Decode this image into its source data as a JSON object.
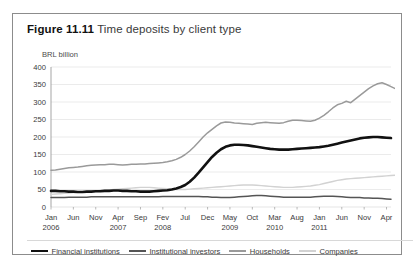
{
  "figure": {
    "number": "Figure 11.11",
    "title": "Time deposits by client type"
  },
  "axis": {
    "unit_label": "BRL billion",
    "y_ticks": [
      "400",
      "350",
      "300",
      "250",
      "200",
      "150",
      "100",
      "50",
      "0"
    ],
    "x_ticks": [
      {
        "month": "Jan",
        "year": "2006"
      },
      {
        "month": "Jun",
        "year": ""
      },
      {
        "month": "Nov",
        "year": ""
      },
      {
        "month": "Apr",
        "year": "2007"
      },
      {
        "month": "Sep",
        "year": ""
      },
      {
        "month": "Fev",
        "year": "2008"
      },
      {
        "month": "Jul",
        "year": ""
      },
      {
        "month": "Dec",
        "year": ""
      },
      {
        "month": "May",
        "year": "2009"
      },
      {
        "month": "Oct",
        "year": ""
      },
      {
        "month": "Mar",
        "year": "2010"
      },
      {
        "month": "Aug",
        "year": ""
      },
      {
        "month": "Jan",
        "year": "2011"
      },
      {
        "month": "Jun",
        "year": ""
      },
      {
        "month": "Nov",
        "year": ""
      },
      {
        "month": "Apr",
        "year": ""
      }
    ]
  },
  "legend": {
    "items": [
      {
        "label": "Financial institutions",
        "color": "#111111",
        "width": 2.6
      },
      {
        "label": "Institutional investors",
        "color": "#555555",
        "width": 1.5
      },
      {
        "label": "Households",
        "color": "#9a9a9a",
        "width": 1.5
      },
      {
        "label": "Companies",
        "color": "#d2d2d2",
        "width": 1.4
      }
    ]
  },
  "chart_data": {
    "type": "line",
    "title": "Time deposits by client type",
    "xlabel": "",
    "ylabel": "BRL billion",
    "ylim": [
      0,
      400
    ],
    "ytick_step": 50,
    "grid": true,
    "grid_color": "#e2e2e2",
    "legend_position": "bottom",
    "x_tick_labels": [
      "Jan 2006",
      "Jun",
      "Nov",
      "Apr 2007",
      "Sep",
      "Fev 2008",
      "Jul",
      "Dec",
      "May 2009",
      "Oct",
      "Mar 2010",
      "Aug",
      "Jan 2011",
      "Jun",
      "Nov",
      "Apr"
    ],
    "x_tick_index": [
      0,
      5,
      10,
      15,
      20,
      25,
      30,
      35,
      40,
      45,
      50,
      55,
      60,
      65,
      70,
      75
    ],
    "x_count": 77,
    "series": [
      {
        "name": "Financial institutions",
        "color": "#111111",
        "line_width": 2.6,
        "values": [
          46,
          46,
          45,
          45,
          44,
          44,
          43,
          43,
          44,
          44,
          45,
          45,
          46,
          46,
          47,
          47,
          46,
          46,
          45,
          45,
          44,
          44,
          44,
          45,
          46,
          47,
          48,
          50,
          53,
          57,
          63,
          72,
          84,
          98,
          113,
          128,
          143,
          155,
          165,
          172,
          176,
          178,
          178,
          177,
          176,
          174,
          172,
          170,
          168,
          166,
          165,
          164,
          164,
          164,
          165,
          166,
          167,
          168,
          169,
          170,
          171,
          173,
          175,
          178,
          181,
          184,
          187,
          190,
          193,
          196,
          198,
          199,
          200,
          200,
          199,
          198,
          197
        ]
      },
      {
        "name": "Institutional investors",
        "color": "#555555",
        "line_width": 1.5,
        "values": [
          27,
          27,
          27,
          27,
          28,
          28,
          28,
          28,
          28,
          29,
          29,
          29,
          29,
          29,
          29,
          29,
          29,
          29,
          29,
          29,
          29,
          29,
          29,
          29,
          29,
          30,
          30,
          30,
          30,
          30,
          30,
          30,
          30,
          30,
          29,
          29,
          28,
          28,
          27,
          27,
          27,
          28,
          29,
          30,
          31,
          32,
          33,
          33,
          32,
          31,
          30,
          29,
          28,
          28,
          28,
          28,
          28,
          28,
          28,
          29,
          30,
          31,
          31,
          31,
          30,
          29,
          28,
          27,
          27,
          27,
          26,
          26,
          25,
          25,
          24,
          23,
          22
        ]
      },
      {
        "name": "Households",
        "color": "#9a9a9a",
        "line_width": 1.5,
        "values": [
          105,
          106,
          108,
          110,
          112,
          113,
          114,
          116,
          118,
          119,
          120,
          121,
          121,
          122,
          122,
          121,
          120,
          121,
          122,
          122,
          123,
          123,
          124,
          125,
          126,
          127,
          129,
          132,
          136,
          142,
          150,
          160,
          172,
          186,
          200,
          212,
          222,
          232,
          240,
          243,
          242,
          240,
          239,
          238,
          237,
          236,
          239,
          241,
          242,
          241,
          240,
          239,
          241,
          245,
          248,
          248,
          247,
          246,
          245,
          248,
          254,
          262,
          272,
          283,
          292,
          296,
          302,
          298,
          308,
          318,
          328,
          338,
          346,
          352,
          355,
          350,
          344,
          338,
          336,
          342,
          345,
          341,
          338
        ]
      },
      {
        "name": "Companies",
        "color": "#d2d2d2",
        "line_width": 1.4,
        "values": [
          36,
          37,
          38,
          39,
          40,
          41,
          42,
          43,
          44,
          45,
          46,
          47,
          48,
          49,
          50,
          51,
          52,
          53,
          54,
          55,
          56,
          56,
          56,
          55,
          54,
          53,
          52,
          51,
          50,
          50,
          50,
          51,
          52,
          53,
          54,
          55,
          56,
          57,
          58,
          59,
          60,
          61,
          62,
          63,
          63,
          63,
          62,
          61,
          60,
          59,
          58,
          57,
          56,
          56,
          56,
          57,
          58,
          59,
          60,
          62,
          64,
          67,
          70,
          73,
          76,
          78,
          80,
          81,
          82,
          83,
          84,
          85,
          86,
          87,
          88,
          89,
          90,
          91,
          92,
          90,
          89,
          89,
          90
        ]
      }
    ]
  }
}
